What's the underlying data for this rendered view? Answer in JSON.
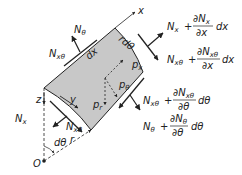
{
  "diagram": {
    "colors": {
      "element_fill": "#c8c8c8",
      "stroke": "#222222",
      "background": "#ffffff"
    },
    "axes": {
      "x": "x",
      "y": "y",
      "z": "z",
      "origin": "O"
    },
    "element_labels": {
      "dx": "dx",
      "rdtheta": "rdθ"
    },
    "loads": {
      "px": "p",
      "px_sub": "x",
      "ptheta": "p",
      "ptheta_sub": "θ",
      "pr": "p",
      "pr_sub": "r"
    },
    "geometry_labels": {
      "dtheta": "dθ",
      "r": "r"
    },
    "forces_left": {
      "Ntheta": {
        "N": "N",
        "sub": "θ"
      },
      "Nxtheta_top": {
        "N": "N",
        "sub": "xθ"
      },
      "Nx": {
        "N": "N",
        "sub": "x"
      },
      "Nxtheta_bottom": {
        "N": "N",
        "sub": "xθ"
      }
    },
    "forces_right": {
      "Nx_plus": {
        "N": "N",
        "sub": "x",
        "plus": "+",
        "num": "∂N",
        "num_sub": "x",
        "den": "∂x",
        "d": "dx"
      },
      "Nxtheta_plus_x": {
        "N": "N",
        "sub": "xθ",
        "plus": "+",
        "num": "∂N",
        "num_sub": "xθ",
        "den": "∂x",
        "d": "dx"
      },
      "Nxtheta_plus_theta": {
        "N": "N",
        "sub": "xθ",
        "plus": "+",
        "num": "∂N",
        "num_sub": "xθ",
        "den": "∂θ",
        "d": "dθ"
      },
      "Ntheta_plus": {
        "N": "N",
        "sub": "θ",
        "plus": "+",
        "num": "∂N",
        "num_sub": "θ",
        "den": "∂θ",
        "d": "dθ"
      }
    }
  }
}
